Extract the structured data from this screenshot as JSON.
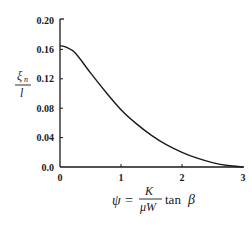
{
  "chart_data": {
    "type": "line",
    "title": "",
    "xlabel": "ψ = (K / μW) tan β",
    "ylabel": "ξn / l",
    "xlim": [
      0,
      3
    ],
    "ylim": [
      0,
      0.2
    ],
    "x_ticks": [
      "0",
      "1",
      "2",
      "3"
    ],
    "y_ticks": [
      "0.0",
      "0.04",
      "0.08",
      "0.12",
      "0.16",
      "0.20"
    ],
    "grid": false,
    "legend": null,
    "series": [
      {
        "name": "ξn/l vs ψ",
        "x": [
          0,
          0.1,
          0.25,
          0.5,
          0.75,
          1.0,
          1.25,
          1.5,
          1.75,
          2.0,
          2.25,
          2.5,
          2.75,
          3.0
        ],
        "values": [
          0.165,
          0.163,
          0.155,
          0.128,
          0.102,
          0.078,
          0.059,
          0.043,
          0.03,
          0.02,
          0.012,
          0.006,
          0.002,
          0.0
        ]
      }
    ]
  },
  "axes": {
    "y_label_numerator": "ξ",
    "y_label_subscript": "n",
    "y_label_denominator": "l",
    "x_label_lhs": "ψ =",
    "x_label_frac_num": "K",
    "x_label_frac_den": "μW",
    "x_label_rhs_fn": "tan",
    "x_label_rhs_var": "β"
  },
  "colors": {
    "line": "#1a1a1a",
    "axis": "#1a1a1a",
    "background": "#ffffff"
  }
}
